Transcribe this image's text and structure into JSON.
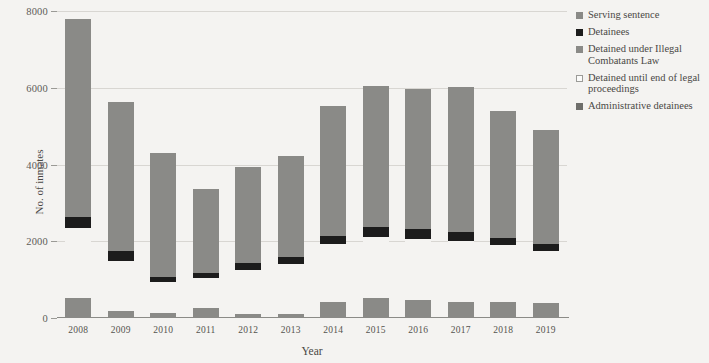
{
  "chart_data": {
    "type": "bar",
    "subtype": "stacked",
    "title": "",
    "xlabel": "Year",
    "ylabel": "No. of inmates",
    "categories": [
      "2008",
      "2009",
      "2010",
      "2011",
      "2012",
      "2013",
      "2014",
      "2015",
      "2016",
      "2017",
      "2018",
      "2019"
    ],
    "ylim": [
      0,
      8000
    ],
    "yticks": [
      0,
      2000,
      4000,
      6000,
      8000
    ],
    "ytick_labels": [
      "0",
      "2000",
      "4000",
      "6000",
      "8000"
    ],
    "grid": true,
    "legend_position": "right",
    "series": [
      {
        "name": "Serving sentence",
        "color": "#8a8a87",
        "values": [
          5150,
          3880,
          3250,
          2190,
          2500,
          2620,
          3370,
          3680,
          3640,
          3760,
          3320,
          2970
        ]
      },
      {
        "name": "Detainees",
        "color": "#1c1c1c",
        "values": [
          280,
          260,
          130,
          130,
          180,
          180,
          230,
          260,
          260,
          250,
          180,
          180
        ]
      },
      {
        "name": "Detained under Illegal Combatants Law",
        "color": "#8a8a87",
        "values": [
          0,
          0,
          0,
          0,
          0,
          0,
          0,
          0,
          0,
          0,
          0,
          0
        ]
      },
      {
        "name": "Detained until end of legal proceedings",
        "color": "#f4f3f1",
        "values": [
          1830,
          1300,
          790,
          780,
          1140,
          1320,
          1490,
          1570,
          1600,
          1580,
          1470,
          1350
        ]
      },
      {
        "name": "Administrative detainees",
        "color": "#8a8a87",
        "values": [
          520,
          180,
          140,
          260,
          110,
          100,
          430,
          530,
          460,
          420,
          430,
          400
        ]
      }
    ],
    "totals": [
      7780,
      5620,
      4310,
      3360,
      3930,
      4220,
      5520,
      6040,
      5960,
      6010,
      5400,
      4900
    ]
  },
  "legend": {
    "items": [
      {
        "label": "Serving sentence",
        "swatch": "#8a8a87",
        "icon": "legend-square-gray"
      },
      {
        "label": "Detainees",
        "swatch": "#1c1c1c",
        "icon": "legend-square-black"
      },
      {
        "label": "Detained under Illegal Combatants Law",
        "swatch": "#8a8a87",
        "icon": "legend-square-gray"
      },
      {
        "label": "Detained until end of legal proceedings",
        "swatch": "#fbfbfa",
        "icon": "legend-square-white"
      },
      {
        "label": "Administrative detainees",
        "swatch": "#6e6e6b",
        "icon": "legend-square-darkgray"
      }
    ]
  }
}
